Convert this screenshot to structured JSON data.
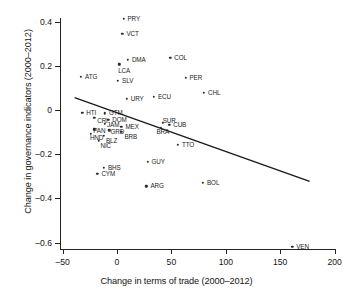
{
  "chart_data": {
    "type": "scatter",
    "title": "",
    "xlabel": "Change in terms of trade (2000–2012)",
    "ylabel": "Change in governance indicators (2000–2012)",
    "xlim": [
      -60,
      205
    ],
    "ylim": [
      -0.66,
      0.46
    ],
    "xticks": [
      -50,
      0,
      50,
      100,
      150,
      200
    ],
    "xtick_labels": [
      "–50",
      "0",
      "50",
      "100",
      "150",
      "200"
    ],
    "yticks": [
      0.4,
      0.2,
      0,
      -0.2,
      -0.4,
      -0.6
    ],
    "ytick_labels": [
      "0.4",
      "0.2",
      "0",
      "–0.2",
      "–0.4",
      "–0.6"
    ],
    "grid": false,
    "legend": "none",
    "marker_color": "#2b2b2b",
    "line_color": "#1a1a1a",
    "points": [
      {
        "label": "PRY",
        "x": 6,
        "y": 0.413,
        "lx": 4,
        "ly": -3
      },
      {
        "label": "VCT",
        "x": 5,
        "y": 0.345,
        "lx": 4,
        "ly": -3
      },
      {
        "label": "DMA",
        "x": 10,
        "y": 0.228,
        "lx": 4,
        "ly": -3
      },
      {
        "label": "COL",
        "x": 49,
        "y": 0.235,
        "lx": 4,
        "ly": -3
      },
      {
        "label": "LCA",
        "x": 2,
        "y": 0.207,
        "lx": -1,
        "ly": 4
      },
      {
        "label": "ATG",
        "x": -33,
        "y": 0.15,
        "lx": 4,
        "ly": -3
      },
      {
        "label": "PER",
        "x": 63,
        "y": 0.145,
        "lx": 4,
        "ly": -3
      },
      {
        "label": "SLV",
        "x": 1,
        "y": 0.132,
        "lx": 4,
        "ly": -3
      },
      {
        "label": "CHL",
        "x": 80,
        "y": 0.078,
        "lx": 4,
        "ly": -3
      },
      {
        "label": "URY",
        "x": 9,
        "y": 0.052,
        "lx": 4,
        "ly": -3
      },
      {
        "label": "ECU",
        "x": 34,
        "y": 0.06,
        "lx": 4,
        "ly": -3
      },
      {
        "label": "HTI",
        "x": -32,
        "y": -0.012,
        "lx": 4,
        "ly": -3
      },
      {
        "label": "GTM",
        "x": -11,
        "y": -0.015,
        "lx": 4,
        "ly": -3
      },
      {
        "label": "CRI",
        "x": -21,
        "y": -0.036,
        "lx": 3,
        "ly": 0
      },
      {
        "label": "DOM",
        "x": -8,
        "y": -0.044,
        "lx": 4,
        "ly": -3
      },
      {
        "label": "SUR",
        "x": 42,
        "y": -0.058,
        "lx": 0,
        "ly": -5
      },
      {
        "label": "CUB",
        "x": 48,
        "y": -0.068,
        "lx": 4,
        "ly": -3
      },
      {
        "label": "JAM",
        "x": -11,
        "y": -0.062,
        "lx": 2,
        "ly": -2
      },
      {
        "label": "MEX",
        "x": 4,
        "y": -0.076,
        "lx": 4,
        "ly": -3
      },
      {
        "label": "BRA",
        "x": 40,
        "y": -0.08,
        "lx": -4,
        "ly": 1
      },
      {
        "label": "PAN",
        "x": -21,
        "y": -0.088,
        "lx": -1,
        "ly": -1
      },
      {
        "label": "GRD",
        "x": -7,
        "y": -0.092,
        "lx": 1,
        "ly": -1
      },
      {
        "label": "HND",
        "x": -24,
        "y": -0.108,
        "lx": -1,
        "ly": 1
      },
      {
        "label": "BRB",
        "x": 4,
        "y": -0.1,
        "lx": 3,
        "ly": 2
      },
      {
        "label": "BLZ",
        "x": -12,
        "y": -0.118,
        "lx": 2,
        "ly": 2
      },
      {
        "label": "NIC",
        "x": -17,
        "y": -0.14,
        "lx": 2,
        "ly": 2
      },
      {
        "label": "TTO",
        "x": 56,
        "y": -0.158,
        "lx": 4,
        "ly": -3
      },
      {
        "label": "GUY",
        "x": 28,
        "y": -0.233,
        "lx": 4,
        "ly": -3
      },
      {
        "label": "BHS",
        "x": -12,
        "y": -0.263,
        "lx": 4,
        "ly": -3
      },
      {
        "label": "CYM",
        "x": -18,
        "y": -0.29,
        "lx": 4,
        "ly": -3
      },
      {
        "label": "ARG",
        "x": 27,
        "y": -0.345,
        "lx": 4,
        "ly": -3
      },
      {
        "label": "BOL",
        "x": 79,
        "y": -0.33,
        "lx": 4,
        "ly": -3
      },
      {
        "label": "VEN",
        "x": 161,
        "y": -0.618,
        "lx": 4,
        "ly": -3
      }
    ],
    "trendline": {
      "x1": -39,
      "y1": 0.056,
      "x2": 177,
      "y2": -0.323
    }
  }
}
